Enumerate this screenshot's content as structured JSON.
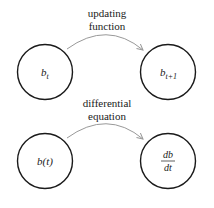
{
  "diagram": {
    "rows": [
      {
        "edge_label_line1": "updating",
        "edge_label_line2": "function",
        "left_node": {
          "base": "b",
          "sub": "t"
        },
        "right_node": {
          "base": "b",
          "sub": "t+1"
        }
      },
      {
        "edge_label_line1": "differential",
        "edge_label_line2": "equation",
        "left_node": {
          "text": "b(t)"
        },
        "right_node": {
          "num": "db",
          "den": "dt"
        }
      }
    ],
    "colors": {
      "circle": "#1a1a1a",
      "arrow": "#999999",
      "text": "#1a1a1a"
    }
  }
}
